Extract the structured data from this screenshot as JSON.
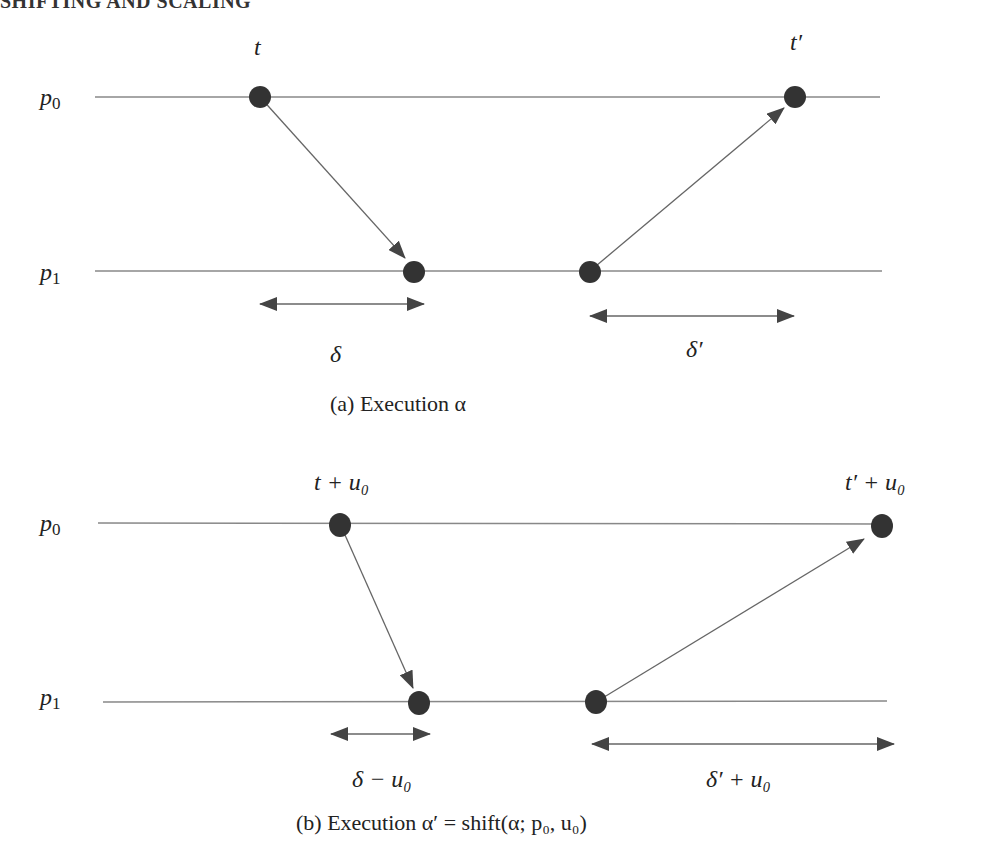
{
  "header": {
    "text": "SHIFTING AND SCALING"
  },
  "figure_a": {
    "caption": "(a) Execution α",
    "process_labels": [
      "p₀",
      "p₁"
    ],
    "event_labels": {
      "send_p0": "t",
      "recv_p0": "t′"
    },
    "delay_labels": {
      "first": "δ",
      "second": "δ′"
    }
  },
  "figure_b": {
    "caption": "(b) Execution α′ = shift(α; p₀, u₀)",
    "process_labels": [
      "p₀",
      "p₁"
    ],
    "event_labels": {
      "send_p0": "t + u₀",
      "recv_p0": "t′ + u₀"
    },
    "delay_labels": {
      "first": "δ − u₀",
      "second": "δ′ + u₀"
    }
  },
  "colors": {
    "line": "#888888",
    "dot": "#333333",
    "arrow": "#444444"
  }
}
